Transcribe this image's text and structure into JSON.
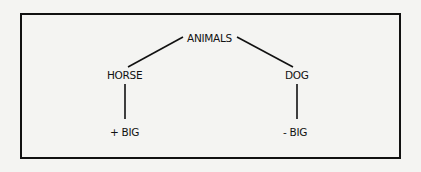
{
  "diagram": {
    "type": "tree",
    "root": {
      "label": "ANIMALS"
    },
    "nodes": [
      {
        "id": "animals",
        "label": "ANIMALS"
      },
      {
        "id": "horse",
        "label": "HORSE"
      },
      {
        "id": "dog",
        "label": "DOG"
      },
      {
        "id": "horse_feature",
        "label": "+ BIG"
      },
      {
        "id": "dog_feature",
        "label": "- BIG"
      }
    ],
    "edges": [
      {
        "from": "animals",
        "to": "horse"
      },
      {
        "from": "animals",
        "to": "dog"
      },
      {
        "from": "horse",
        "to": "horse_feature"
      },
      {
        "from": "dog",
        "to": "dog_feature"
      }
    ],
    "colors": {
      "line": "#111111",
      "background": "#f4f4f2"
    }
  }
}
